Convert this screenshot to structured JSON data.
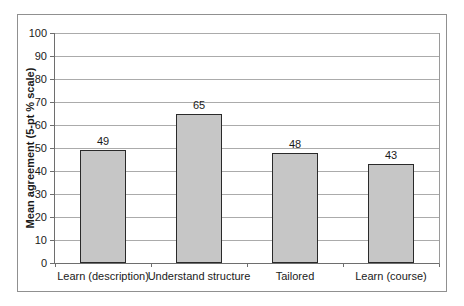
{
  "chart_data": {
    "type": "bar",
    "categories": [
      "Learn (description)",
      "Understand structure",
      "Tailored",
      "Learn (course)"
    ],
    "values": [
      49,
      65,
      48,
      43
    ],
    "data_labels": [
      "49",
      "65",
      "48",
      "43"
    ],
    "title": "",
    "xlabel": "",
    "ylabel": "Mean agreement (5-pt % scale)",
    "ylim": [
      0,
      100
    ],
    "ytick_step": 10,
    "ytick_labels": [
      "0",
      "10",
      "20",
      "30",
      "40",
      "50",
      "60",
      "70",
      "80",
      "90",
      "100"
    ],
    "grid": true,
    "legend": "none",
    "colors": {
      "bar_fill": "#c6c6c6",
      "bar_border": "#2a2a2a",
      "gridline": "#ababab",
      "axis_line": "#6e6e6e",
      "frame_border": "#909090",
      "text": "#1a1a1a",
      "background": "#ffffff"
    }
  }
}
